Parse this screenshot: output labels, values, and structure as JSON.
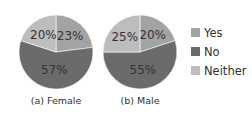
{
  "chart_data": [
    {
      "type": "pie",
      "title": "(a) Female",
      "categories": [
        "Yes",
        "No",
        "Neither"
      ],
      "values": [
        23,
        57,
        20
      ],
      "labels": [
        "23%",
        "57%",
        "20%"
      ],
      "colors": [
        "#a3a3a3",
        "#6b6b6b",
        "#bdbdbd"
      ]
    },
    {
      "type": "pie",
      "title": "(b) Male",
      "categories": [
        "Yes",
        "No",
        "Neither"
      ],
      "values": [
        20,
        55,
        25
      ],
      "labels": [
        "20%",
        "55%",
        "25%"
      ],
      "colors": [
        "#a3a3a3",
        "#6b6b6b",
        "#bdbdbd"
      ]
    }
  ],
  "legend": {
    "position": "right",
    "items": [
      {
        "label": "Yes",
        "color": "#a3a3a3"
      },
      {
        "label": "No",
        "color": "#6b6b6b"
      },
      {
        "label": "Neither",
        "color": "#bdbdbd"
      }
    ]
  }
}
